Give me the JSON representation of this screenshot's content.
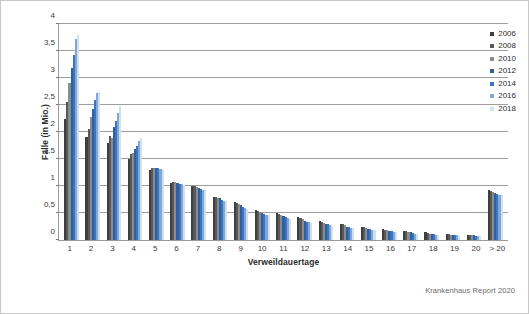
{
  "chart_data": {
    "type": "bar",
    "title": "",
    "xlabel": "Verweildauertage",
    "ylabel": "Fälle (in Mio.)",
    "ylim": [
      0,
      4
    ],
    "ytick_labels": [
      "0",
      "0,5",
      "1",
      "1,5",
      "2",
      "2,5",
      "3",
      "3,5",
      "4"
    ],
    "ytick_values": [
      0,
      0.5,
      1,
      1.5,
      2,
      2.5,
      3,
      3.5,
      4
    ],
    "grid": true,
    "legend_position": "top-right",
    "categories": [
      "1",
      "2",
      "3",
      "4",
      "5",
      "6",
      "7",
      "8",
      "9",
      "10",
      "11",
      "12",
      "13",
      "14",
      "15",
      "16",
      "17",
      "18",
      "19",
      "20",
      "> 20"
    ],
    "series": [
      {
        "name": "2006",
        "color": "#3f3f3f",
        "values": [
          2.25,
          1.9,
          1.8,
          1.5,
          1.3,
          1.05,
          1.0,
          0.8,
          0.7,
          0.55,
          0.5,
          0.42,
          0.35,
          0.3,
          0.25,
          0.2,
          0.17,
          0.14,
          0.12,
          0.1,
          0.92
        ]
      },
      {
        "name": "2008",
        "color": "#595959",
        "values": [
          2.55,
          2.05,
          1.92,
          1.6,
          1.33,
          1.07,
          1.0,
          0.79,
          0.68,
          0.54,
          0.48,
          0.4,
          0.34,
          0.29,
          0.24,
          0.19,
          0.16,
          0.13,
          0.11,
          0.1,
          0.9
        ]
      },
      {
        "name": "2010",
        "color": "#8c8c8c",
        "values": [
          2.9,
          2.28,
          1.88,
          1.62,
          1.33,
          1.07,
          0.99,
          0.78,
          0.66,
          0.52,
          0.46,
          0.38,
          0.32,
          0.27,
          0.22,
          0.18,
          0.15,
          0.12,
          0.1,
          0.09,
          0.88
        ]
      },
      {
        "name": "2012",
        "color": "#2f5f9e",
        "values": [
          3.18,
          2.42,
          2.1,
          1.68,
          1.34,
          1.06,
          0.97,
          0.77,
          0.64,
          0.5,
          0.44,
          0.36,
          0.3,
          0.25,
          0.21,
          0.17,
          0.14,
          0.12,
          0.1,
          0.09,
          0.87
        ]
      },
      {
        "name": "2014",
        "color": "#3c74bd"
      },
      {
        "name": "2016",
        "color": "#7fa8d8"
      },
      {
        "name": "2018",
        "color": "#cfe0f2"
      }
    ],
    "series_values_2014": [
      3.42,
      2.6,
      2.2,
      1.74,
      1.33,
      1.04,
      0.95,
      0.75,
      0.62,
      0.49,
      0.42,
      0.34,
      0.29,
      0.24,
      0.2,
      0.16,
      0.13,
      0.11,
      0.09,
      0.08,
      0.86
    ],
    "series_values_2016": [
      3.72,
      2.72,
      2.35,
      1.83,
      1.32,
      1.03,
      0.93,
      0.73,
      0.6,
      0.47,
      0.4,
      0.33,
      0.27,
      0.23,
      0.19,
      0.15,
      0.12,
      0.1,
      0.09,
      0.08,
      0.84
    ],
    "series_values_2018": [
      3.8,
      2.74,
      2.48,
      1.88,
      1.3,
      1.02,
      0.92,
      0.72,
      0.58,
      0.46,
      0.39,
      0.32,
      0.26,
      0.22,
      0.18,
      0.14,
      0.12,
      0.1,
      0.08,
      0.07,
      0.83
    ]
  },
  "legend": {
    "items": [
      {
        "label": "2006",
        "color": "#3f3f3f"
      },
      {
        "label": "2008",
        "color": "#595959"
      },
      {
        "label": "2010",
        "color": "#8c8c8c"
      },
      {
        "label": "2012",
        "color": "#2f5f9e"
      },
      {
        "label": "2014",
        "color": "#3c74bd"
      },
      {
        "label": "2016",
        "color": "#7fa8d8"
      },
      {
        "label": "2018",
        "color": "#cfe0f2"
      }
    ]
  },
  "source_note": "Krankenhaus Report 2020"
}
